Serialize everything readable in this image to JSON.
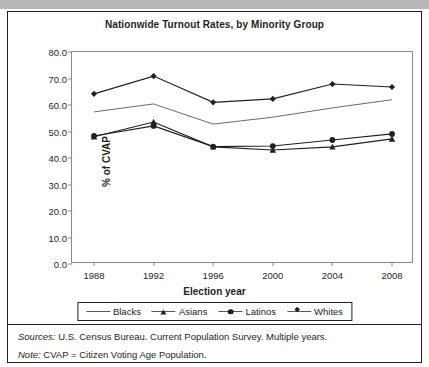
{
  "figure": {
    "title": "Nationwide Turnout Rates, by Minority Group",
    "sources_label": "Sources:",
    "sources_text": " U.S. Census Bureau. Current Population Survey. Multiple years.",
    "note_label": "Note:",
    "note_text": " CVAP = Citizen Voting Age Population."
  },
  "chart_data": {
    "type": "line",
    "title": "Nationwide Turnout Rates, by Minority Group",
    "xlabel": "Election year",
    "ylabel": "% of CVAP",
    "categories": [
      "1988",
      "1992",
      "1996",
      "2000",
      "2004",
      "2008"
    ],
    "x": [
      1988,
      1992,
      1996,
      2000,
      2004,
      2008
    ],
    "ylim": [
      0,
      80
    ],
    "yticks": [
      "0.0",
      "10.0",
      "20.0",
      "30.0",
      "40.0",
      "50.0",
      "60.0",
      "70.0",
      "80.0"
    ],
    "ytick_values": [
      0,
      10,
      20,
      30,
      40,
      50,
      60,
      70,
      80
    ],
    "grid": false,
    "legend_position": "bottom",
    "series": [
      {
        "name": "Blacks",
        "marker": "none",
        "color": "#58595b",
        "values": [
          57.4,
          60.4,
          52.8,
          55.4,
          58.9,
          62.0
        ]
      },
      {
        "name": "Asians",
        "marker": "triangle",
        "color": "#231f20",
        "values": [
          48.0,
          53.6,
          44.2,
          43.0,
          44.2,
          47.2
        ]
      },
      {
        "name": "Latinos",
        "marker": "circle",
        "color": "#231f20",
        "values": [
          48.3,
          52.1,
          44.3,
          44.5,
          46.8,
          49.1
        ]
      },
      {
        "name": "Whites",
        "marker": "diamond",
        "color": "#231f20",
        "values": [
          64.2,
          70.9,
          61.0,
          62.3,
          67.9,
          66.8
        ]
      }
    ]
  }
}
